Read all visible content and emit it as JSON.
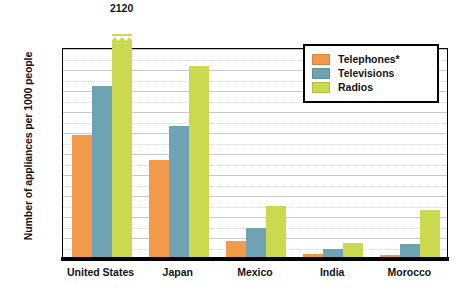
{
  "chart_data": {
    "type": "bar",
    "title": "",
    "xlabel": "",
    "ylabel": "Number of appliances per 1000 people",
    "ylim": [
      0,
      1000
    ],
    "ytick_step": 100,
    "yticks": [
      "0",
      "100",
      "200",
      "300",
      "400",
      "500",
      "600",
      "700",
      "800",
      "900",
      "1000"
    ],
    "grid": true,
    "grid_minor_dotted": true,
    "legend_position": "top-right",
    "categories": [
      "United States",
      "Japan",
      "Mexico",
      "India",
      "Morocco"
    ],
    "series": [
      {
        "name": "Telephones*",
        "color": "#F2994A",
        "values": [
          585,
          465,
          80,
          20,
          12
        ],
        "labels": [
          "",
          "",
          "",
          "",
          ""
        ]
      },
      {
        "name": "Televisions",
        "color": "#6FA3B4",
        "values": [
          818,
          628,
          145,
          45,
          65
        ],
        "labels": [
          "",
          "",
          "",
          "",
          ""
        ]
      },
      {
        "name": "Radios",
        "color": "#CAD94F",
        "values": [
          2120,
          916,
          250,
          70,
          228
        ],
        "labels": [
          "2120",
          "",
          "",
          "",
          ""
        ],
        "broken_axis": [
          true,
          false,
          false,
          false,
          false
        ]
      }
    ],
    "annotations": [
      {
        "text": "2120",
        "series": "Radios",
        "category": "United States"
      }
    ]
  },
  "legend": {
    "items": [
      {
        "label": "Telephones*",
        "color": "#F2994A",
        "swatch": "telephones-swatch"
      },
      {
        "label": "Televisions",
        "color": "#6FA3B4",
        "swatch": "televisions-swatch"
      },
      {
        "label": "Radios",
        "color": "#CAD94F",
        "swatch": "radios-swatch"
      }
    ]
  }
}
